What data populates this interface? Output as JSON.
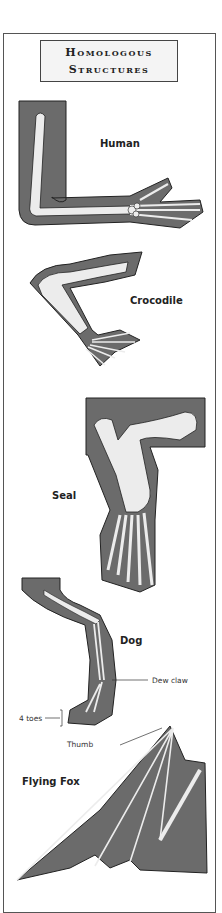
{
  "title": {
    "line1": "Homologous",
    "line2": "Structures"
  },
  "colors": {
    "fill": "#6b6b6b",
    "bone": "#ececec",
    "outline": "#222222"
  },
  "animals": [
    {
      "name": "Human"
    },
    {
      "name": "Crocodile"
    },
    {
      "name": "Seal"
    },
    {
      "name": "Dog"
    },
    {
      "name": "Flying Fox"
    }
  ],
  "annotations": {
    "dew_claw": "Dew claw",
    "four_toes": "4 toes",
    "thumb": "Thumb"
  }
}
